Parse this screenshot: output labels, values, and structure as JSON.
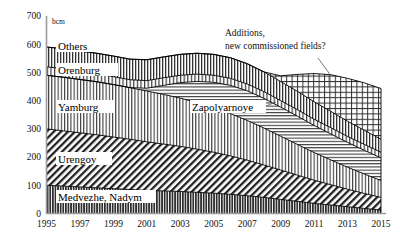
{
  "chart_data": {
    "type": "area",
    "title": "",
    "subtitle": "",
    "xlabel": "",
    "ylabel": "bcm",
    "unit": "bcm",
    "grid": false,
    "legend_position": "inline-labels",
    "stacked": true,
    "xlim": [
      1995,
      2015
    ],
    "ylim": [
      0,
      700
    ],
    "yticks": [
      0,
      100,
      200,
      300,
      400,
      500,
      600,
      700
    ],
    "xticks": [
      1995,
      1997,
      1999,
      2001,
      2003,
      2005,
      2007,
      2009,
      2011,
      2013,
      2015
    ],
    "x": [
      1995,
      1996,
      1997,
      1998,
      1999,
      2000,
      2001,
      2002,
      2003,
      2004,
      2005,
      2006,
      2007,
      2008,
      2009,
      2010,
      2011,
      2012,
      2013,
      2014,
      2015
    ],
    "series": [
      {
        "name": "Medvezhe, Nadym",
        "label": "Medvezhe, Nadym",
        "pattern": "dense-vertical-dark",
        "values": [
          100,
          97,
          94,
          91,
          88,
          85,
          82,
          80,
          78,
          75,
          72,
          68,
          63,
          57,
          50,
          43,
          36,
          30,
          24,
          18,
          12
        ]
      },
      {
        "name": "Urengoy",
        "label": "Urengoy",
        "pattern": "diagonal-hatch",
        "values": [
          200,
          196,
          192,
          188,
          183,
          178,
          172,
          166,
          160,
          153,
          145,
          136,
          126,
          115,
          104,
          93,
          82,
          72,
          62,
          53,
          45
        ]
      },
      {
        "name": "Yamburg",
        "label": "Yamburg",
        "pattern": "fine-vertical",
        "values": [
          190,
          190,
          189,
          188,
          186,
          183,
          180,
          176,
          171,
          165,
          158,
          150,
          141,
          131,
          120,
          109,
          98,
          88,
          78,
          69,
          60
        ]
      },
      {
        "name": "Zapolyarnoye",
        "label": "Zapolyarnoye",
        "pattern": "horizontal-lines",
        "values": [
          0,
          0,
          0,
          0,
          0,
          0,
          10,
          32,
          55,
          75,
          90,
          100,
          105,
          105,
          103,
          100,
          96,
          92,
          88,
          84,
          80
        ]
      },
      {
        "name": "Orenburg",
        "label": "Orenburg",
        "pattern": "fine-vertical",
        "values": [
          30,
          30,
          29,
          29,
          28,
          28,
          27,
          27,
          26,
          26,
          25,
          25,
          24,
          24,
          23,
          23,
          22,
          22,
          21,
          21,
          20
        ]
      },
      {
        "name": "Others",
        "label": "Others",
        "pattern": "medium-vertical",
        "values": [
          70,
          71,
          72,
          72,
          73,
          73,
          74,
          74,
          74,
          74,
          74,
          73,
          72,
          70,
          68,
          65,
          62,
          58,
          54,
          50,
          46
        ]
      },
      {
        "name": "Additions, new commissioned fields?",
        "label": "Additions,\nnew commissioned fields?",
        "pattern": "cross-hatch",
        "values": [
          0,
          0,
          0,
          0,
          0,
          0,
          0,
          0,
          0,
          0,
          0,
          0,
          0,
          0,
          20,
          60,
          100,
          130,
          152,
          168,
          180
        ]
      }
    ],
    "totals": [
      590,
      584,
      576,
      568,
      558,
      547,
      545,
      555,
      564,
      568,
      564,
      552,
      531,
      502,
      488,
      493,
      496,
      492,
      479,
      463,
      443
    ],
    "annotations": [
      {
        "name": "additions-annotation",
        "text_line1": "Additions,",
        "text_line2": "new commissioned fields?",
        "leader": true
      }
    ]
  },
  "axis": {
    "y_unit": "bcm",
    "y_tick_labels": [
      "700",
      "600",
      "500",
      "400",
      "300",
      "200",
      "100",
      "0"
    ],
    "x_tick_labels": [
      "1995",
      "1997",
      "1999",
      "2001",
      "2003",
      "2005",
      "2007",
      "2009",
      "2011",
      "2013",
      "2015"
    ]
  },
  "series_labels": {
    "others": "Others",
    "orenburg": "Orenburg",
    "yamburg": "Yamburg",
    "zapolyarnoye": "Zapolyarnoye",
    "urengoy": "Urengoy",
    "medvezhe_nadym": "Medvezhe, Nadym"
  },
  "annotation": {
    "line1": "Additions,",
    "line2": "new commissioned fields?"
  },
  "colors": {
    "ink": "#000000",
    "axis": "#9a9a9a",
    "background": "#ffffff"
  }
}
